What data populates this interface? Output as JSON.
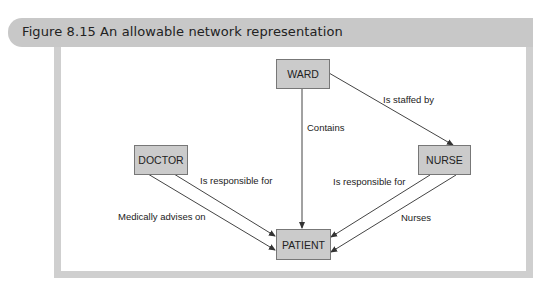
{
  "figure": {
    "title": "Figure 8.15 An allowable network representation"
  },
  "nodes": {
    "ward": "WARD",
    "doctor": "DOCTOR",
    "nurse": "NURSE",
    "patient": "PATIENT"
  },
  "edges": [
    {
      "from": "WARD",
      "to": "PATIENT",
      "label": "Contains"
    },
    {
      "from": "WARD",
      "to": "NURSE",
      "label": "Is staffed by"
    },
    {
      "from": "DOCTOR",
      "to": "PATIENT",
      "label": "Is responsible for"
    },
    {
      "from": "DOCTOR",
      "to": "PATIENT",
      "label": "Medically advises on"
    },
    {
      "from": "NURSE",
      "to": "PATIENT",
      "label": "Is responsible for"
    },
    {
      "from": "NURSE",
      "to": "PATIENT",
      "label": "Nurses"
    }
  ],
  "colors": {
    "header_bg": "#c8c8c8",
    "frame": "#cfcfcf",
    "node_fill": "#cbcbcb",
    "line": "#444444"
  }
}
